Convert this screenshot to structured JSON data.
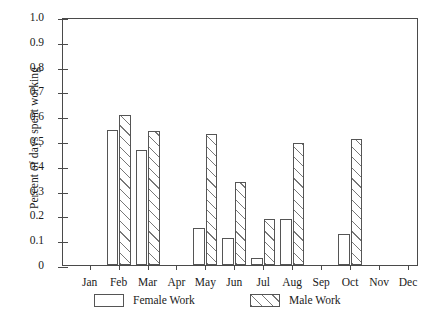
{
  "chart_data": {
    "type": "bar",
    "title": "",
    "subtitle": "",
    "xlabel": "",
    "ylabel": "Percent of days spent working",
    "categories": [
      "Jan",
      "Feb",
      "Mar",
      "Apr",
      "May",
      "Jun",
      "Jul",
      "Aug",
      "Sep",
      "Oct",
      "Nov",
      "Dec"
    ],
    "series": [
      {
        "name": "Female Work",
        "style": "open",
        "values": [
          0,
          0.545,
          0.465,
          0,
          0.15,
          0.11,
          0.03,
          0.185,
          0,
          0.125,
          0,
          0
        ]
      },
      {
        "name": "Male Work",
        "style": "hatched",
        "values": [
          0,
          0.605,
          0.54,
          0,
          0.53,
          0.335,
          0.185,
          0.49,
          0,
          0.51,
          0,
          0
        ]
      }
    ],
    "ylim": [
      0,
      1.0
    ],
    "ytick_values": [
      0,
      0.1,
      0.2,
      0.3,
      0.4,
      0.5,
      0.6,
      0.7,
      0.8,
      0.9,
      1.0
    ],
    "ytick_labels": [
      "0",
      "0.1",
      "0.2",
      "0.3",
      "0.4",
      "0.5",
      "0.6",
      "0.7",
      "0.8",
      "0.9",
      "1.0"
    ],
    "grid": false,
    "legend_position": "below-axes",
    "frame": "box"
  },
  "legend": {
    "entries": [
      {
        "label": "Female Work",
        "style": "open"
      },
      {
        "label": "Male Work",
        "style": "hatched"
      }
    ]
  },
  "colors": {
    "axis": "#4a4a4a",
    "bar_edge": "#555555",
    "bar_fill": "#ffffff",
    "hatch": "#777777",
    "text": "#1a1a1a",
    "background": "#ffffff"
  }
}
